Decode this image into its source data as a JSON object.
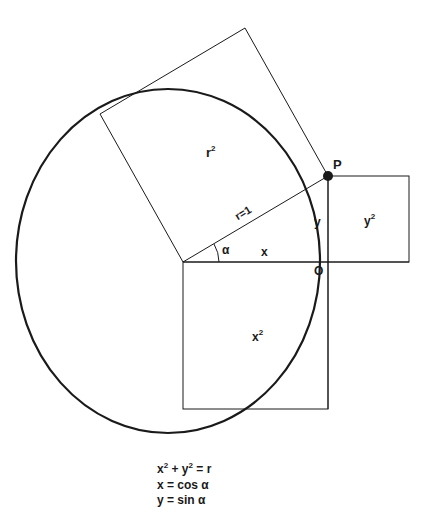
{
  "diagram": {
    "colors": {
      "stroke": "#1a1a1a",
      "background": "#ffffff"
    },
    "labels": {
      "r_squared": {
        "base": "r",
        "exp": "2"
      },
      "point_p": "P",
      "radius": "r=1",
      "y_side": "y",
      "y_squared": {
        "base": "y",
        "exp": "2"
      },
      "angle": "α",
      "x_side": "x",
      "origin": "O",
      "x_squared": {
        "base": "x",
        "exp": "2"
      }
    },
    "formulas": [
      {
        "text": "x² + y² = r"
      },
      {
        "text": "x = cos α"
      },
      {
        "text": "y = sin α"
      }
    ],
    "formula_parts": {
      "line1": {
        "x": "x",
        "exp1": "2",
        "plus": "+ y",
        "exp2": "2",
        "rest": "= r"
      },
      "line2": "x = cos α",
      "line3": "y = sin α"
    }
  }
}
